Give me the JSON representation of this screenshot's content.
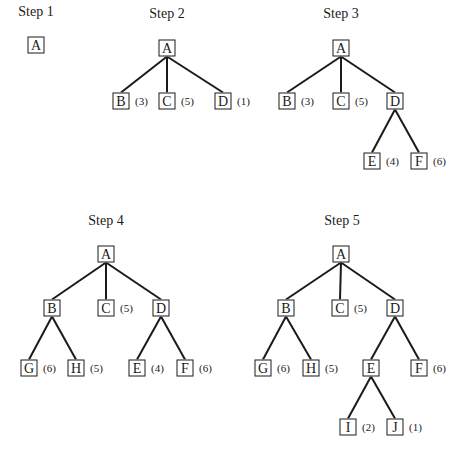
{
  "figure": "Best-first search tree expansion",
  "steps": [
    {
      "title": "Step 1",
      "nodes": [
        {
          "id": "A",
          "x": 36,
          "y": 45,
          "cost": null
        }
      ],
      "edges": []
    },
    {
      "title": "Step 2",
      "nodes": [
        {
          "id": "A",
          "x": 167,
          "y": 48,
          "cost": null
        },
        {
          "id": "B",
          "x": 121,
          "y": 101,
          "cost": "(3)"
        },
        {
          "id": "C",
          "x": 167,
          "y": 101,
          "cost": "(5)"
        },
        {
          "id": "D",
          "x": 223,
          "y": 101,
          "cost": "(1)"
        }
      ],
      "edges": [
        [
          "A",
          "B"
        ],
        [
          "A",
          "C"
        ],
        [
          "A",
          "D"
        ]
      ]
    },
    {
      "title": "Step 3",
      "nodes": [
        {
          "id": "A",
          "x": 341,
          "y": 48,
          "cost": null
        },
        {
          "id": "B",
          "x": 287,
          "y": 101,
          "cost": "(3)"
        },
        {
          "id": "C",
          "x": 341,
          "y": 101,
          "cost": "(5)"
        },
        {
          "id": "D",
          "x": 395,
          "y": 101,
          "cost": null
        },
        {
          "id": "E",
          "x": 372,
          "y": 161,
          "cost": "(4)"
        },
        {
          "id": "F",
          "x": 419,
          "y": 161,
          "cost": "(6)"
        }
      ],
      "edges": [
        [
          "A",
          "B"
        ],
        [
          "A",
          "C"
        ],
        [
          "A",
          "D"
        ],
        [
          "D",
          "E"
        ],
        [
          "D",
          "F"
        ]
      ]
    },
    {
      "title": "Step 4",
      "nodes": [
        {
          "id": "A",
          "x": 106,
          "y": 254,
          "cost": null
        },
        {
          "id": "B",
          "x": 52,
          "y": 308,
          "cost": null
        },
        {
          "id": "C",
          "x": 106,
          "y": 308,
          "cost": "(5)"
        },
        {
          "id": "D",
          "x": 161,
          "y": 308,
          "cost": null
        },
        {
          "id": "G",
          "x": 29,
          "y": 368,
          "cost": "(6)"
        },
        {
          "id": "H",
          "x": 76,
          "y": 368,
          "cost": "(5)"
        },
        {
          "id": "E",
          "x": 137,
          "y": 368,
          "cost": "(4)"
        },
        {
          "id": "F",
          "x": 185,
          "y": 368,
          "cost": "(6)"
        }
      ],
      "edges": [
        [
          "A",
          "B"
        ],
        [
          "A",
          "C"
        ],
        [
          "A",
          "D"
        ],
        [
          "B",
          "G"
        ],
        [
          "B",
          "H"
        ],
        [
          "D",
          "E"
        ],
        [
          "D",
          "F"
        ]
      ]
    },
    {
      "title": "Step 5",
      "nodes": [
        {
          "id": "A",
          "x": 341,
          "y": 254,
          "cost": null
        },
        {
          "id": "B",
          "x": 286,
          "y": 308,
          "cost": null
        },
        {
          "id": "C",
          "x": 340,
          "y": 308,
          "cost": "(5)"
        },
        {
          "id": "D",
          "x": 395,
          "y": 308,
          "cost": null
        },
        {
          "id": "G",
          "x": 263,
          "y": 368,
          "cost": "(6)"
        },
        {
          "id": "H",
          "x": 311,
          "y": 368,
          "cost": "(5)"
        },
        {
          "id": "E",
          "x": 371,
          "y": 368,
          "cost": null
        },
        {
          "id": "F",
          "x": 419,
          "y": 368,
          "cost": "(6)"
        },
        {
          "id": "I",
          "x": 348,
          "y": 427,
          "cost": "(2)"
        },
        {
          "id": "J",
          "x": 395,
          "y": 427,
          "cost": "(1)"
        }
      ],
      "edges": [
        [
          "A",
          "B"
        ],
        [
          "A",
          "C"
        ],
        [
          "A",
          "D"
        ],
        [
          "B",
          "G"
        ],
        [
          "B",
          "H"
        ],
        [
          "D",
          "E"
        ],
        [
          "D",
          "F"
        ],
        [
          "E",
          "I"
        ],
        [
          "E",
          "J"
        ]
      ]
    }
  ],
  "title_positions": [
    {
      "x": 36,
      "y": 12
    },
    {
      "x": 167,
      "y": 14
    },
    {
      "x": 341,
      "y": 14
    },
    {
      "x": 106,
      "y": 221
    },
    {
      "x": 342,
      "y": 221
    }
  ]
}
